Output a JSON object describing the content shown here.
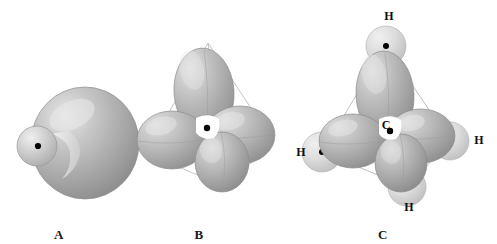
{
  "figure": {
    "type": "orbital-diagram",
    "background_color": "#ffffff"
  },
  "palette": {
    "lobe_mid": "#a9a9a9",
    "lobe_light": "#d9d9d9",
    "lobe_highlight": "#eaeaea",
    "lobe_shadow": "#8b8b8b",
    "lobe_edge": "#8f8f8f",
    "sphere_light": "#e2e2e2",
    "sphere_mid": "#c6c6c6",
    "sphere_edge": "#b0b0b0",
    "wireframe": "#b9b9b9",
    "nucleus": "#000000",
    "text": "#111111"
  },
  "panels": [
    {
      "id": "a",
      "label": "A",
      "label_x": 59,
      "label_y": 227,
      "caption_meaning": "single sp3 hybrid orbital",
      "nucleus": {
        "x": 38,
        "y": 146
      },
      "orbital": {
        "major_lobe": {
          "cx": 85,
          "cy": 143,
          "rx": 54,
          "ry": 56
        },
        "minor_lobe": {
          "cx": 37,
          "cy": 146,
          "rx": 20,
          "ry": 20
        }
      }
    },
    {
      "id": "b",
      "label": "B",
      "label_x": 199,
      "label_y": 227,
      "caption_meaning": "four sp3 orbitals in tetrahedral arrangement",
      "nucleus": {
        "x": 207,
        "y": 128
      },
      "tetrahedron": {
        "apex": {
          "x": 208,
          "y": 43
        },
        "left": {
          "x": 146,
          "y": 153
        },
        "right": {
          "x": 272,
          "y": 140
        },
        "front_bottom": {
          "x": 228,
          "y": 188
        }
      },
      "lobes": [
        {
          "name": "up",
          "cx": 204,
          "cy": 92,
          "rx": 30,
          "ry": 44,
          "rot": -4
        },
        {
          "name": "left",
          "cx": 172,
          "cy": 140,
          "rx": 35,
          "ry": 29,
          "rot": 0
        },
        {
          "name": "right",
          "cx": 240,
          "cy": 135,
          "rx": 35,
          "ry": 29,
          "rot": 0
        },
        {
          "name": "front",
          "cx": 222,
          "cy": 162,
          "rx": 27,
          "ry": 30,
          "rot": 0
        }
      ]
    },
    {
      "id": "c",
      "label": "C",
      "label_x": 383,
      "label_y": 227,
      "caption_meaning": "methane CH4 with four sigma C-H bonds",
      "center_atom": {
        "symbol": "C",
        "label_x": 376,
        "label_y": 118,
        "nucleus": {
          "x": 390,
          "y": 131
        }
      },
      "hydrogens": [
        {
          "symbol": "H",
          "label_x": 379,
          "label_y": 9,
          "sphere": {
            "cx": 386,
            "cy": 46,
            "r": 20
          },
          "nucleus": {
            "x": 386,
            "y": 46
          }
        },
        {
          "symbol": "H",
          "label_x": 291,
          "label_y": 145,
          "sphere": {
            "cx": 322,
            "cy": 152,
            "r": 20
          },
          "nucleus": {
            "x": 322,
            "y": 152
          }
        },
        {
          "symbol": "H",
          "label_x": 469,
          "label_y": 133,
          "sphere": {
            "cx": 450,
            "cy": 141,
            "r": 19
          },
          "nucleus": {
            "x": 450,
            "y": 141
          }
        },
        {
          "symbol": "H",
          "label_x": 399,
          "label_y": 200,
          "sphere": {
            "cx": 407,
            "cy": 187,
            "r": 19
          },
          "nucleus": {
            "x": 407,
            "y": 187
          }
        }
      ],
      "lobes": [
        {
          "name": "up",
          "cx": 385,
          "cy": 95,
          "rx": 29,
          "ry": 44,
          "rot": -3
        },
        {
          "name": "left",
          "cx": 353,
          "cy": 141,
          "rx": 34,
          "ry": 27,
          "rot": 0
        },
        {
          "name": "right",
          "cx": 421,
          "cy": 136,
          "rx": 34,
          "ry": 27,
          "rot": 0
        },
        {
          "name": "front",
          "cx": 401,
          "cy": 163,
          "rx": 26,
          "ry": 29,
          "rot": 0
        }
      ],
      "bonds": [
        {
          "from": "center",
          "to": "H-top"
        },
        {
          "from": "center",
          "to": "H-left"
        },
        {
          "from": "center",
          "to": "H-right"
        },
        {
          "from": "center",
          "to": "H-bottom"
        }
      ]
    }
  ]
}
